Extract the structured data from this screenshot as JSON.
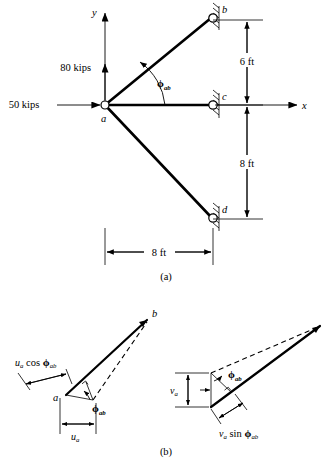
{
  "figure": {
    "panels": [
      {
        "id": "a",
        "caption": "(a)"
      },
      {
        "id": "b",
        "caption": "(b)"
      }
    ]
  },
  "panel_a": {
    "caption": "(a)",
    "axes": {
      "x_label": "x",
      "y_label": "y"
    },
    "loads": [
      {
        "name": "horizontal-load",
        "label": "50 kips",
        "direction": "right"
      },
      {
        "name": "vertical-load",
        "label": "80 kips",
        "direction": "up"
      }
    ],
    "joints": [
      {
        "name": "joint-a",
        "label": "a",
        "support": false
      },
      {
        "name": "joint-b",
        "label": "b",
        "support": true
      },
      {
        "name": "joint-c",
        "label": "c",
        "support": true
      },
      {
        "name": "joint-d",
        "label": "d",
        "support": true
      }
    ],
    "members": [
      {
        "name": "member-ab",
        "from": "a",
        "to": "b"
      },
      {
        "name": "member-ac",
        "from": "a",
        "to": "c"
      },
      {
        "name": "member-ad",
        "from": "a",
        "to": "d"
      }
    ],
    "angle_label": "ϕ",
    "angle_sub": "ab",
    "dimensions": [
      {
        "name": "dim-vertical-upper",
        "label": "6 ft",
        "orientation": "vertical"
      },
      {
        "name": "dim-vertical-lower",
        "label": "8 ft",
        "orientation": "vertical"
      },
      {
        "name": "dim-horizontal",
        "label": "8 ft",
        "orientation": "horizontal"
      }
    ]
  },
  "panel_b": {
    "caption": "(b)",
    "left_diagram": {
      "name": "u-component-diagram",
      "vertex_label": "a",
      "tip_label": "b",
      "angle_label": "ϕ",
      "angle_sub": "ab",
      "projection_var": "u",
      "projection_sub": "a",
      "projection_label": "cos",
      "projection_full": "uₐ cos ϕₐᵇ",
      "base_var": "u",
      "base_sub": "a"
    },
    "right_diagram": {
      "name": "v-component-diagram",
      "angle_label": "ϕ",
      "angle_sub": "ab",
      "projection_var": "v",
      "projection_sub": "a",
      "projection_label": "sin",
      "projection_full": "vₐ sin ϕₐᵇ",
      "base_var": "v",
      "base_sub": "a"
    }
  }
}
